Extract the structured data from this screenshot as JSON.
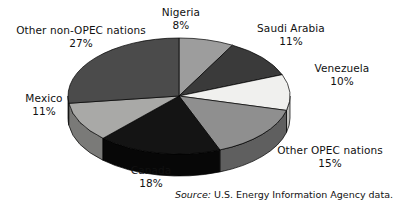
{
  "chart_data": {
    "type": "pie",
    "title": "",
    "subtitle": "",
    "xlabel": "",
    "ylabel": "",
    "legend_position": "outside-labels",
    "grid": false,
    "three_d": true,
    "start_angle_deg": 0,
    "direction": "clockwise",
    "categories": [
      "Nigeria",
      "Saudi Arabia",
      "Venezuela",
      "Other OPEC nations",
      "Canada",
      "Mexico",
      "Other non-OPEC nations"
    ],
    "values": [
      8,
      11,
      10,
      15,
      18,
      11,
      27
    ],
    "unit": "%",
    "slices": [
      {
        "label": "Nigeria",
        "value": 8,
        "percent_text": "8%",
        "color": "#9d9d9d",
        "side_color": "#6f6f6f"
      },
      {
        "label": "Saudi Arabia",
        "value": 11,
        "percent_text": "11%",
        "color": "#3a3a3a",
        "side_color": "#242424"
      },
      {
        "label": "Venezuela",
        "value": 10,
        "percent_text": "10%",
        "color": "#f0f0ee",
        "side_color": "#c0c0bd"
      },
      {
        "label": "Other OPEC nations",
        "value": 15,
        "percent_text": "15%",
        "color": "#8f8f8f",
        "side_color": "#5f5f5f"
      },
      {
        "label": "Canada",
        "value": 18,
        "percent_text": "18%",
        "color": "#141414",
        "side_color": "#070707"
      },
      {
        "label": "Mexico",
        "value": 11,
        "percent_text": "11%",
        "color": "#a9a9a7",
        "side_color": "#7a7a78"
      },
      {
        "label": "Other non-OPEC nations",
        "value": 27,
        "percent_text": "27%",
        "color": "#4b4b4b",
        "side_color": "#2e2e2e"
      }
    ]
  },
  "labels": {
    "other_non_opec": {
      "name": "Other non-OPEC nations",
      "percent": "27%"
    },
    "nigeria": {
      "name": "Nigeria",
      "percent": "8%"
    },
    "saudi_arabia": {
      "name": "Saudi Arabia",
      "percent": "11%"
    },
    "venezuela": {
      "name": "Venezuela",
      "percent": "10%"
    },
    "other_opec": {
      "name": "Other OPEC nations",
      "percent": "15%"
    },
    "canada": {
      "name": "Canada",
      "percent": "18%"
    },
    "mexico": {
      "name": "Mexico",
      "percent": "11%"
    }
  },
  "source": {
    "prefix": "Source:",
    "text": "U.S. Energy Information Agency data."
  },
  "geometry": {
    "cx": 179,
    "cy": 96,
    "rx": 111,
    "ry": 58,
    "depth": 22
  }
}
